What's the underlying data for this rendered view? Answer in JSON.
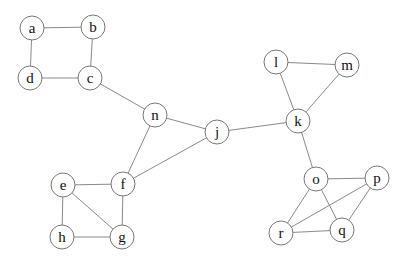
{
  "graph": {
    "node_radius": 12,
    "nodes": [
      {
        "id": "a",
        "label": "a",
        "x": 32,
        "y": 28
      },
      {
        "id": "b",
        "label": "b",
        "x": 93,
        "y": 27
      },
      {
        "id": "c",
        "label": "c",
        "x": 90,
        "y": 78
      },
      {
        "id": "d",
        "label": "d",
        "x": 30,
        "y": 78
      },
      {
        "id": "n",
        "label": "n",
        "x": 155,
        "y": 115
      },
      {
        "id": "j",
        "label": "j",
        "x": 217,
        "y": 132
      },
      {
        "id": "f",
        "label": "f",
        "x": 123,
        "y": 184
      },
      {
        "id": "e",
        "label": "e",
        "x": 63,
        "y": 185
      },
      {
        "id": "h",
        "label": "h",
        "x": 62,
        "y": 237
      },
      {
        "id": "g",
        "label": "g",
        "x": 122,
        "y": 237
      },
      {
        "id": "k",
        "label": "k",
        "x": 298,
        "y": 121
      },
      {
        "id": "l",
        "label": "l",
        "x": 276,
        "y": 62
      },
      {
        "id": "m",
        "label": "m",
        "x": 347,
        "y": 65
      },
      {
        "id": "o",
        "label": "o",
        "x": 316,
        "y": 179
      },
      {
        "id": "p",
        "label": "p",
        "x": 377,
        "y": 178
      },
      {
        "id": "r",
        "label": "r",
        "x": 281,
        "y": 233
      },
      {
        "id": "q",
        "label": "q",
        "x": 342,
        "y": 230
      }
    ],
    "edges": [
      [
        "a",
        "b"
      ],
      [
        "b",
        "c"
      ],
      [
        "c",
        "d"
      ],
      [
        "d",
        "a"
      ],
      [
        "c",
        "n"
      ],
      [
        "n",
        "j"
      ],
      [
        "n",
        "f"
      ],
      [
        "f",
        "j"
      ],
      [
        "j",
        "k"
      ],
      [
        "e",
        "f"
      ],
      [
        "f",
        "g"
      ],
      [
        "g",
        "h"
      ],
      [
        "h",
        "e"
      ],
      [
        "e",
        "g"
      ],
      [
        "k",
        "l"
      ],
      [
        "l",
        "m"
      ],
      [
        "m",
        "k"
      ],
      [
        "k",
        "o"
      ],
      [
        "o",
        "p"
      ],
      [
        "o",
        "r"
      ],
      [
        "o",
        "q"
      ],
      [
        "p",
        "r"
      ],
      [
        "p",
        "q"
      ],
      [
        "r",
        "q"
      ]
    ]
  }
}
